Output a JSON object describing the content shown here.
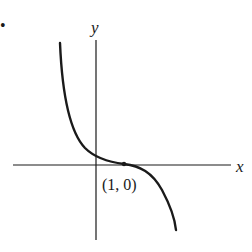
{
  "diagram": {
    "type": "function-graph",
    "bullet": "•",
    "axes": {
      "x_label": "x",
      "y_label": "y"
    },
    "point": {
      "label": "(1, 0)",
      "x": 1,
      "y": 0
    },
    "curve": {
      "description": "decreasing cubic-like curve with horizontal inflection at (1, 0)",
      "shape": "y = -(x - 1)^3"
    },
    "colors": {
      "ink": "#1a1a1a",
      "background": "#ffffff"
    }
  }
}
